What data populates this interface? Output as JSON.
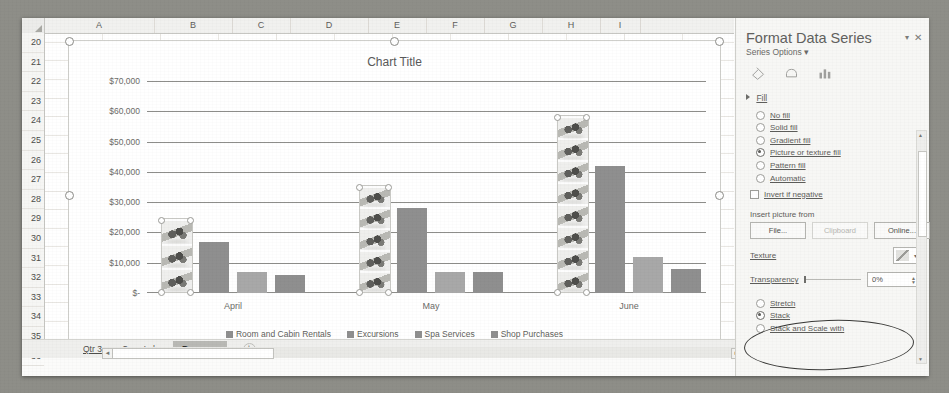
{
  "spreadsheet": {
    "columns": [
      "A",
      "B",
      "C",
      "D",
      "E",
      "F",
      "G",
      "H",
      "I"
    ],
    "rows": [
      "20",
      "21",
      "22",
      "23",
      "24",
      "25",
      "26",
      "27",
      "28",
      "29",
      "30",
      "31",
      "32",
      "33",
      "34",
      "35",
      "36"
    ],
    "tabs": [
      {
        "label": "Qtr 3",
        "active": false
      },
      {
        "label": "Cass Lake",
        "active": false
      },
      {
        "label": "Revenue",
        "active": true
      }
    ],
    "new_sheet_label": "+",
    "scroll_left_arrow": "◄",
    "scroll_right_arrow": "►"
  },
  "chart_data": {
    "type": "bar",
    "title": "Chart Title",
    "categories": [
      "April",
      "May",
      "June"
    ],
    "series": [
      {
        "name": "Room and Cabin Rentals",
        "values": [
          24000,
          35000,
          58000
        ],
        "fill": "picture"
      },
      {
        "name": "Excursions",
        "values": [
          17000,
          28000,
          42000
        ],
        "fill": "solid"
      },
      {
        "name": "Spa Services",
        "values": [
          7000,
          7000,
          12000
        ],
        "fill": "solid-light"
      },
      {
        "name": "Shop Purchases",
        "values": [
          6000,
          7000,
          8000
        ],
        "fill": "solid"
      }
    ],
    "ylabel": "",
    "xlabel": "",
    "ylim": [
      0,
      70000
    ],
    "yticks": [
      "$-",
      "$10,000",
      "$20,000",
      "$30,000",
      "$40,000",
      "$50,000",
      "$60,000",
      "$70,000"
    ],
    "ytick_values": [
      0,
      10000,
      20000,
      30000,
      40000,
      50000,
      60000,
      70000
    ],
    "grid": true,
    "legend_position": "bottom"
  },
  "pane": {
    "title": "Format Data Series",
    "subtitle": "Series Options",
    "subtitle_caret": "▾",
    "close_label": "✕",
    "chevron_label": "▾",
    "icons": [
      "fill-and-line-icon",
      "effects-icon",
      "series-options-icon"
    ],
    "fill_section": {
      "label": "Fill",
      "options": [
        {
          "label": "No fill",
          "selected": false
        },
        {
          "label": "Solid fill",
          "selected": false
        },
        {
          "label": "Gradient fill",
          "selected": false
        },
        {
          "label": "Picture or texture fill",
          "selected": true
        },
        {
          "label": "Pattern fill",
          "selected": false
        },
        {
          "label": "Automatic",
          "selected": false
        }
      ],
      "invert_if_negative": {
        "label": "Invert if negative",
        "checked": false
      }
    },
    "insert_picture": {
      "label": "Insert picture from",
      "buttons": [
        {
          "label": "File...",
          "disabled": false
        },
        {
          "label": "Clipboard",
          "disabled": true
        },
        {
          "label": "Online...",
          "disabled": false
        }
      ]
    },
    "texture": {
      "label": "Texture",
      "caret": "▾"
    },
    "transparency": {
      "label": "Transparency",
      "value": "0%",
      "up": "▲",
      "down": "▼"
    },
    "tiling_options": [
      {
        "label": "Stretch",
        "selected": false
      },
      {
        "label": "Stack",
        "selected": true
      },
      {
        "label": "Stack and Scale with",
        "selected": false
      }
    ],
    "scroll_up": "▲",
    "scroll_down": "▼"
  }
}
